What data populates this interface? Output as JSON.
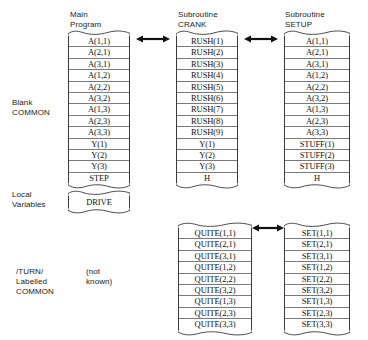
{
  "diagram": {
    "title_columns": [
      {
        "id": "main",
        "label": "Main\nProgram"
      },
      {
        "id": "crank",
        "label": "Subroutine\nCRANK"
      },
      {
        "id": "setup",
        "label": "Subroutine\nSETUP"
      }
    ],
    "side_labels": [
      {
        "id": "blank-common",
        "label": "Blank\nCOMMON"
      },
      {
        "id": "local-variables",
        "label": "Local\nVariables"
      },
      {
        "id": "turn-labelled-common",
        "label": "/TURN/\nLabelled\nCOMMON"
      },
      {
        "id": "not-known",
        "label": "(not\nknown)"
      }
    ],
    "blocks": {
      "main_blank_common": {
        "name": "Main Program Blank COMMON",
        "cells": [
          "A(1,1)",
          "A(2,1)",
          "A(3,1)",
          "A(1,2)",
          "A(2,2)",
          "A(3,2)",
          "A(1,3)",
          "A(2,3)",
          "A(3,3)",
          "Y(1)",
          "Y(2)",
          "Y(3)",
          "STEP"
        ]
      },
      "crank_blank_common": {
        "name": "Subroutine CRANK Blank COMMON",
        "cells": [
          "RUSH(1)",
          "RUSH(2)",
          "RUSH(3)",
          "RUSH(4)",
          "RUSH(5)",
          "RUSH(6)",
          "RUSH(7)",
          "RUSH(8)",
          "RUSH(9)",
          "Y(1)",
          "Y(2)",
          "Y(3)",
          "H"
        ]
      },
      "setup_blank_common": {
        "name": "Subroutine SETUP Blank COMMON",
        "cells": [
          "A(1,1)",
          "A(2,1)",
          "A(3,1)",
          "A(1,2)",
          "A(2,2)",
          "A(3,2)",
          "A(1,3)",
          "A(2,3)",
          "A(3,3)",
          "STUFF(1)",
          "STUFF(2)",
          "STUFF(3)",
          "H"
        ]
      },
      "main_local_variables": {
        "name": "Main Program Local Variables",
        "cells": [
          "DRIVE"
        ]
      },
      "crank_turn_common": {
        "name": "Subroutine CRANK /TURN/ Labelled COMMON",
        "cells": [
          "QUITE(1,1)",
          "QUITE(2,1)",
          "QUITE(3,1)",
          "QUITE(1,2)",
          "QUITE(2,2)",
          "QUITE(3,2)",
          "QUITE(1,3)",
          "QUITE(2,3)",
          "QUITE(3,3)"
        ]
      },
      "setup_turn_common": {
        "name": "Subroutine SETUP /TURN/ Labelled COMMON",
        "cells": [
          "SET(1,1)",
          "SET(2,1)",
          "SET(3,1)",
          "SET(1,2)",
          "SET(2,2)",
          "SET(3,2)",
          "SET(1,3)",
          "SET(2,3)",
          "SET(3,3)"
        ]
      }
    },
    "connectors": [
      {
        "id": "main-crank-common",
        "type": "double-arrow"
      },
      {
        "id": "crank-setup-common",
        "type": "double-arrow"
      },
      {
        "id": "crank-setup-turn",
        "type": "double-arrow"
      }
    ],
    "colors": {
      "ink": "#111111",
      "rule": "#7a7a7a",
      "edge": "#3a3a3a",
      "background": "#ffffff"
    }
  }
}
